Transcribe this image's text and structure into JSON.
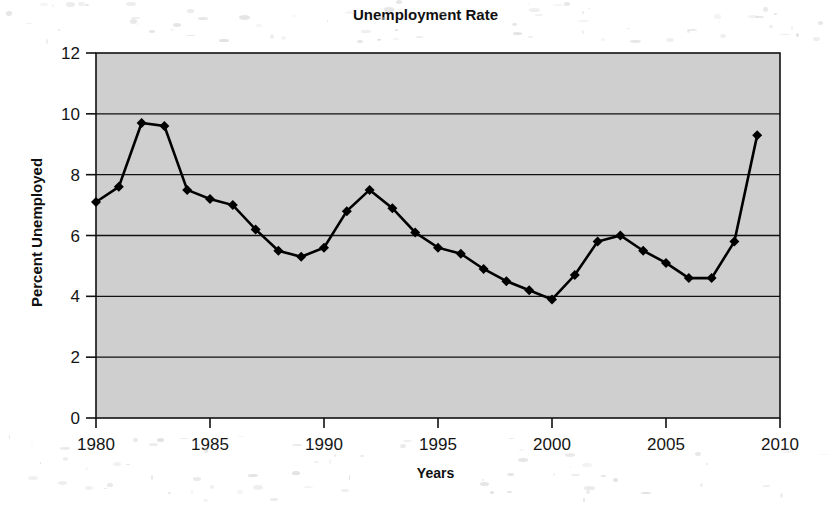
{
  "chart_data": {
    "type": "line",
    "title": "Unemployment Rate",
    "xlabel": "Years",
    "ylabel": "Percent Unemployed",
    "xlim": [
      1980,
      2010
    ],
    "ylim": [
      0,
      12
    ],
    "xticks": [
      "1980",
      "1985",
      "1990",
      "1995",
      "2000",
      "2005",
      "2010"
    ],
    "xtick_values": [
      1980,
      1985,
      1990,
      1995,
      2000,
      2005,
      2010
    ],
    "yticks": [
      "0",
      "2",
      "4",
      "6",
      "8",
      "10",
      "12"
    ],
    "ytick_values": [
      0,
      2,
      4,
      6,
      8,
      10,
      12
    ],
    "grid": "horizontal",
    "legend": "none",
    "marker": "diamond",
    "line_color": "#000000",
    "plot_background": "#cfcfcf",
    "page_background": "#ffffff",
    "x": [
      1980,
      1981,
      1982,
      1983,
      1984,
      1985,
      1986,
      1987,
      1988,
      1989,
      1990,
      1991,
      1992,
      1993,
      1994,
      1995,
      1996,
      1997,
      1998,
      1999,
      2000,
      2001,
      2002,
      2003,
      2004,
      2005,
      2006,
      2007,
      2008,
      2009
    ],
    "values": [
      7.1,
      7.6,
      9.7,
      9.6,
      7.5,
      7.2,
      7.0,
      6.2,
      5.5,
      5.3,
      5.6,
      6.8,
      7.5,
      6.9,
      6.1,
      5.6,
      5.4,
      4.9,
      4.5,
      4.2,
      3.9,
      4.7,
      5.8,
      6.0,
      5.5,
      5.1,
      4.6,
      4.6,
      5.8,
      9.3
    ],
    "series": [
      {
        "name": "Unemployment Rate",
        "values": [
          7.1,
          7.6,
          9.7,
          9.6,
          7.5,
          7.2,
          7.0,
          6.2,
          5.5,
          5.3,
          5.6,
          6.8,
          7.5,
          6.9,
          6.1,
          5.6,
          5.4,
          4.9,
          4.5,
          4.2,
          3.9,
          4.7,
          5.8,
          6.0,
          5.5,
          5.1,
          4.6,
          4.6,
          5.8,
          9.3
        ]
      }
    ]
  }
}
